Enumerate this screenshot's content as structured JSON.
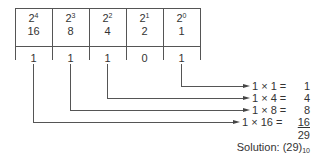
{
  "table": {
    "columns": [
      {
        "base": "2",
        "exp": "4",
        "value": "16",
        "bit": "1"
      },
      {
        "base": "2",
        "exp": "3",
        "value": "8",
        "bit": "1"
      },
      {
        "base": "2",
        "exp": "2",
        "value": "4",
        "bit": "1"
      },
      {
        "base": "2",
        "exp": "1",
        "value": "2",
        "bit": "0"
      },
      {
        "base": "2",
        "exp": "0",
        "value": "1",
        "bit": "1"
      }
    ]
  },
  "equations": [
    {
      "expr": "1 × 1 =",
      "result": "1"
    },
    {
      "expr": "1 × 4 =",
      "result": "4"
    },
    {
      "expr": "1 × 8 =",
      "result": "8"
    },
    {
      "expr": "1 × 16 =",
      "result": "16"
    }
  ],
  "sum": "29",
  "solution": {
    "label": "Solution:",
    "value": "(29)",
    "base": "10"
  }
}
